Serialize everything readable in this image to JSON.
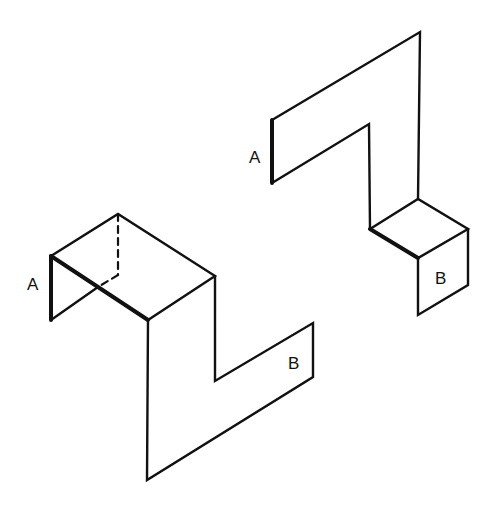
{
  "figures": [
    {
      "name": "left-figure",
      "labels": {
        "a": "A",
        "b": "B"
      }
    },
    {
      "name": "right-figure",
      "labels": {
        "a": "A",
        "b": "B"
      }
    }
  ],
  "colors": {
    "ink": "#111111",
    "background": "#ffffff"
  }
}
